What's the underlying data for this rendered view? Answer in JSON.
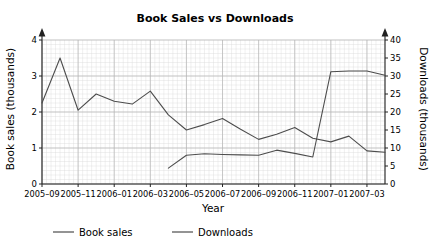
{
  "chart_data": {
    "type": "line",
    "title": "Book Sales vs Downloads",
    "xlabel": "Year",
    "ylabel": "Book sales (thousands)",
    "y2label": "Downloads (thousands)",
    "grid": true,
    "legend_position": "bottom",
    "xlim": [
      0,
      19
    ],
    "ylim": [
      0,
      4
    ],
    "y2lim": [
      0,
      40
    ],
    "yticks": [
      "0",
      "1",
      "2",
      "3",
      "4"
    ],
    "ytick_values": [
      0,
      1,
      2,
      3,
      4
    ],
    "y2ticks": [
      "0",
      "5",
      "10",
      "15",
      "20",
      "25",
      "30",
      "35",
      "40"
    ],
    "y2tick_values": [
      0,
      5,
      10,
      15,
      20,
      25,
      30,
      35,
      40
    ],
    "categories": [
      "2005-09",
      "2005-10",
      "2005-11",
      "2005-12",
      "2006-01",
      "2006-02",
      "2006-03",
      "2006-04",
      "2006-05",
      "2006-06",
      "2006-07",
      "2006-08",
      "2006-09",
      "2006-10",
      "2006-11",
      "2006-12",
      "2007-01",
      "2007-02",
      "2007-03",
      "2007-04"
    ],
    "xtick_labels": [
      "2005–09",
      "2005–11",
      "2006–01",
      "2006–03",
      "2006–05",
      "2006–07",
      "2006–09",
      "2006–11",
      "2007–01",
      "2007–03"
    ],
    "xtick_indices": [
      0,
      2,
      4,
      6,
      8,
      10,
      12,
      14,
      16,
      18
    ],
    "series": [
      {
        "name": "Book sales",
        "axis": "left",
        "color": "#4d4d4d",
        "x": [
          0,
          1,
          2,
          3,
          4,
          5,
          6,
          7,
          8,
          9,
          10,
          11,
          12,
          13,
          14,
          15,
          16,
          17,
          18,
          19
        ],
        "values": [
          2.25,
          3.5,
          2.05,
          2.5,
          2.3,
          2.22,
          2.58,
          1.92,
          1.5,
          1.65,
          1.82,
          1.52,
          1.24,
          1.38,
          1.57,
          1.27,
          1.17,
          1.33,
          0.92,
          0.88
        ]
      },
      {
        "name": "Downloads",
        "axis": "right",
        "color": "#4d4d4d",
        "x": [
          7,
          8,
          9,
          10,
          11,
          12,
          13,
          14,
          15,
          16,
          17,
          18,
          19
        ],
        "values": [
          4.4,
          8.0,
          8.4,
          8.2,
          8.1,
          8.0,
          9.4,
          8.5,
          7.5,
          31.2,
          31.4,
          31.4,
          30.2
        ]
      }
    ],
    "legend": [
      {
        "label": "Book sales",
        "color": "#4d4d4d"
      },
      {
        "label": "Downloads",
        "color": "#4d4d4d"
      }
    ]
  },
  "style": {
    "background": "#ffffff",
    "grid_minor_color": "#d8d8d8",
    "grid_major_color": "#b4b4b4",
    "axis_color": "#222222",
    "text_color": "#000000"
  }
}
